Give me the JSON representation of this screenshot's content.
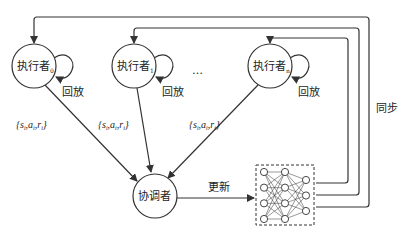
{
  "diagram": {
    "type": "distributed-rl-architecture",
    "actors": [
      {
        "label": "执行者",
        "subscript": "0",
        "replay_label": "回放",
        "transition_label": "{s_i, a_i, r_i}"
      },
      {
        "label": "执行者",
        "subscript": "1",
        "replay_label": "回放",
        "transition_label": "{s_i, a_i, r_i}"
      },
      {
        "label": "执行者",
        "subscript": "n",
        "replay_label": "回放",
        "transition_label": "{s_i, a_i, r_i}"
      }
    ],
    "ellipsis": "…",
    "coordinator": {
      "label": "协调者"
    },
    "update_label": "更新",
    "sync_label": "同步",
    "transition": {
      "open": "{",
      "s": "s",
      "a": "a",
      "r": "r",
      "sub": "i",
      "sep": ",",
      "close": "}"
    },
    "network": {
      "layers": [
        4,
        4,
        3
      ],
      "border": "dashed"
    },
    "colors": {
      "stroke": "#333333",
      "background": "#ffffff",
      "text": "#222222"
    }
  }
}
